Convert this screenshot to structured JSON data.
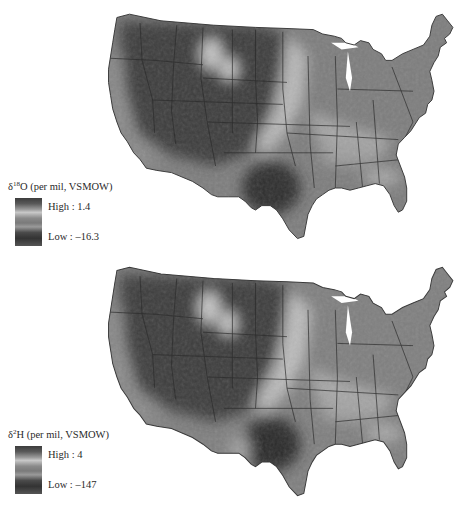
{
  "figure": {
    "panels": [
      {
        "id": "d18O",
        "legend": {
          "symbol": "δ",
          "superscript": "18",
          "element": "O",
          "units": " (per mil, VSMOW)",
          "high_label": "High : 1.4",
          "low_label": "Low : –16.3",
          "high_value": 1.4,
          "low_value": -16.3
        }
      },
      {
        "id": "d2H",
        "legend": {
          "symbol": "δ",
          "superscript": "2",
          "element": "H",
          "units": " (per mil, VSMOW)",
          "high_label": "High : 4",
          "low_label": "Low : –147",
          "high_value": 4,
          "low_value": -147
        }
      }
    ],
    "map_region": "Contiguous United States",
    "color_scale": "grayscale",
    "colors": {
      "high": "#3c3c3c",
      "mid_light": "#c8c8c8",
      "low": "#333333",
      "state_border": "#2b2b2b"
    }
  }
}
